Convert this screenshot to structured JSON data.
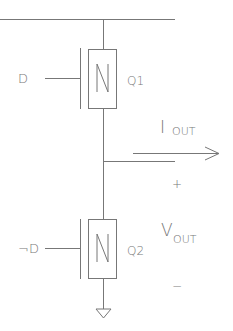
{
  "diagram": {
    "type": "CMOS-like NMOS half-bridge circuit",
    "transistors": [
      {
        "id": "Q1",
        "label": "Q1",
        "type_label": "N",
        "gate_input": "D"
      },
      {
        "id": "Q2",
        "label": "Q2",
        "type_label": "N",
        "gate_input": "¬D"
      }
    ],
    "output": {
      "current_label": "I",
      "current_subscript": "OUT",
      "voltage_label": "V",
      "voltage_subscript": "OUT",
      "plus": "+",
      "minus": "−"
    },
    "ground": "ground"
  }
}
